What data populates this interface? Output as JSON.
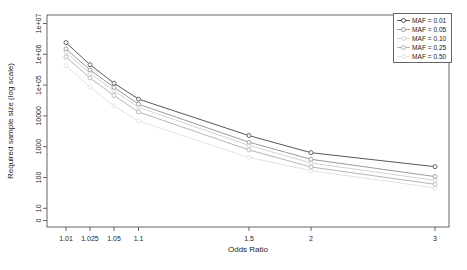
{
  "figure": {
    "xlabel": "Odds Ratio",
    "ylabel": "Required sample size (log scale)"
  },
  "chart_data": {
    "type": "line",
    "title": "",
    "xlabel": "Odds Ratio",
    "ylabel": "Required sample size (log scale)",
    "x": [
      1.01,
      1.025,
      1.05,
      1.1,
      1.5,
      2,
      3
    ],
    "x_tick_labels": [
      "1.01",
      "1.025",
      "1.05",
      "1.1",
      "1.5",
      "2",
      "3"
    ],
    "y_tick_labels": [
      "0",
      "10",
      "100",
      "1000",
      "10000",
      "1e+05",
      "1e+06",
      "1e+07"
    ],
    "yscale": "log",
    "ylim_exponents": [
      0,
      7
    ],
    "grid": false,
    "marker": "open-circle",
    "legend_position": "top-right",
    "series": [
      {
        "name": "MAF = 0.01",
        "color": "#575757",
        "values": [
          2400000,
          460000,
          115000,
          35000,
          2300,
          640,
          225
        ]
      },
      {
        "name": "MAF = 0.05",
        "color": "#9b9b9b",
        "values": [
          1500000,
          310000,
          85000,
          24000,
          1400,
          390,
          107
        ]
      },
      {
        "name": "MAF = 0.10",
        "color": "#d4d4d4",
        "values": [
          1150000,
          240000,
          65000,
          19000,
          1100,
          295,
          81
        ]
      },
      {
        "name": "MAF = 0.25",
        "color": "#b5b5b5",
        "values": [
          820000,
          170000,
          46000,
          13400,
          790,
          220,
          60
        ]
      },
      {
        "name": "MAF = 0.50",
        "color": "#e3e3e3",
        "values": [
          430000,
          87000,
          21000,
          6800,
          450,
          166,
          46
        ]
      }
    ]
  }
}
